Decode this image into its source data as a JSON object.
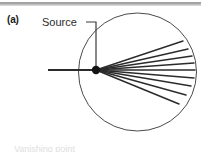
{
  "figure": {
    "panel_label": "(a)",
    "source_label": "Source",
    "bottom_caption_partial": "Vanishing point",
    "line_color": "#2b2b2b",
    "circle_color": "#4a4a4a",
    "rule_color": "#a8a8a8",
    "background_color": "#ffffff"
  },
  "chart_data": {
    "type": "diagram",
    "title": "(a)",
    "annotations": [
      {
        "text": "Source",
        "x": 42,
        "y": 22,
        "leader_to_x": 96,
        "leader_to_y": 68
      }
    ],
    "circle": {
      "cx": 137.5,
      "cy": 72,
      "r": 59
    },
    "source_point": {
      "x": 96,
      "y": 70,
      "r": 4.2
    },
    "incident_ray": {
      "x1": 48,
      "y1": 70,
      "x2": 96,
      "y2": 70
    },
    "leader_line": {
      "x1": 86,
      "y1": 22,
      "x2": 96,
      "y2": 22,
      "x3": 96,
      "y3": 68
    },
    "ray_count": 9,
    "rays": [
      {
        "index": 1,
        "angle_deg": -38,
        "x2": 183,
        "y2": 41
      },
      {
        "index": 2,
        "angle_deg": -29,
        "x2": 188,
        "y2": 49
      },
      {
        "index": 3,
        "angle_deg": -20,
        "x2": 192,
        "y2": 56
      },
      {
        "index": 4,
        "angle_deg": -10,
        "x2": 194,
        "y2": 63
      },
      {
        "index": 5,
        "angle_deg": 0,
        "x2": 195,
        "y2": 70
      },
      {
        "index": 6,
        "angle_deg": 10,
        "x2": 194,
        "y2": 78
      },
      {
        "index": 7,
        "angle_deg": 20,
        "x2": 191,
        "y2": 86
      },
      {
        "index": 8,
        "angle_deg": 30,
        "x2": 186,
        "y2": 95
      },
      {
        "index": 9,
        "angle_deg": 39,
        "x2": 179,
        "y2": 104
      }
    ]
  }
}
